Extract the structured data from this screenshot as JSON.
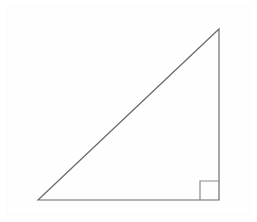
{
  "figure": {
    "kind": "geometry-diagram",
    "title": "",
    "background_color": "#ffffff",
    "frame_color": "#fbfbfb",
    "canvas": {
      "width": 257,
      "height": 222
    }
  },
  "diagram": {
    "shape_name": "right-triangle",
    "stroke_color": "#6b6b6b",
    "stroke_width": 1.2,
    "fill": "none",
    "vertices": [
      {
        "name": "bottom-left-vertex",
        "label": "",
        "x": 38,
        "y": 200
      },
      {
        "name": "bottom-right-vertex",
        "label": "",
        "x": 219,
        "y": 200
      },
      {
        "name": "top-right-vertex",
        "label": "",
        "x": 219,
        "y": 29
      }
    ],
    "edges": [
      {
        "name": "base-edge",
        "label": "",
        "from": 0,
        "to": 1
      },
      {
        "name": "vertical-edge",
        "label": "",
        "from": 1,
        "to": 2
      },
      {
        "name": "hypotenuse-edge",
        "label": "",
        "from": 2,
        "to": 0
      }
    ],
    "right_angle_marker": {
      "name": "right-angle-marker",
      "at_vertex": "bottom-right-vertex",
      "label": "",
      "size": 19,
      "x": 200,
      "y": 181,
      "stroke_color": "#8a8a8a",
      "stroke_width": 1.2
    },
    "annotations": [],
    "labels": []
  }
}
